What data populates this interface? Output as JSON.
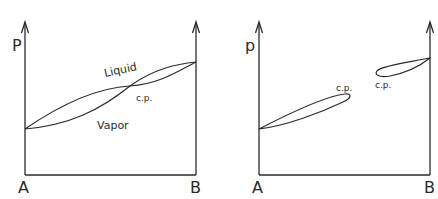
{
  "left_panel": {
    "y_label": "P",
    "x_left_label": "A",
    "x_right_label": "B",
    "region_upper_label": "Liquid",
    "region_lower_label": "Vapor",
    "critical_point_label": "c.p."
  },
  "right_panel": {
    "y_label": "p",
    "x_left_label": "A",
    "x_right_label": "B",
    "lower_cp_label": "c.p.",
    "upper_cp_label": "c.p."
  },
  "colors": {
    "line": "#2a2a2a",
    "background": "#ffffff"
  }
}
